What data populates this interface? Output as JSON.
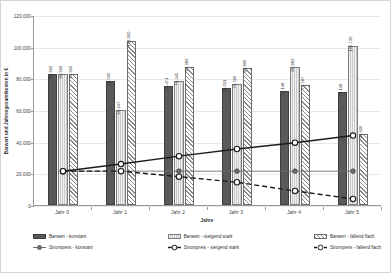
{
  "chart_data": {
    "type": "bar",
    "title": "",
    "subtitle": "",
    "xlabel": "Jahre",
    "ylabel": "Barwert und Jahresgesamtkosten in €",
    "categories": [
      "Jahr 0",
      "Jahr 1",
      "Jahr 2",
      "Jahr 3",
      "Jahr 4",
      "Jahr 5"
    ],
    "ylim": [
      0,
      120000
    ],
    "ytick_labels": [
      "0",
      "20.000",
      "40.000",
      "60.000",
      "80.000",
      "100.000",
      "120.000"
    ],
    "ytick_values": [
      0,
      20000,
      40000,
      60000,
      80000,
      100000,
      120000
    ],
    "grid": true,
    "legend_position": "bottom",
    "bar_series": [
      {
        "name": "Barwert - konstant",
        "style": "solid-dark-gray",
        "color": "#595959",
        "values": [
          82916,
          78505,
          75471,
          74031,
          72148,
          71148
        ],
        "labels": [
          "82.916",
          "78.505",
          "75.471",
          "74.031",
          "72.148",
          "71.148"
        ]
      },
      {
        "name": "Barwert - steigend stark",
        "style": "solid-light-gray",
        "color": "#c9c9c9",
        "values": [
          82916,
          60047,
          78345,
          76320,
          86883,
          100729
        ],
        "labels": [
          "82.916",
          "60.047",
          "78.345",
          "76.320",
          "86.883",
          "100.729"
        ]
      },
      {
        "name": "Barwert - fallend flach",
        "style": "hatched-diagonal",
        "color": "#ffffff",
        "values": [
          82916,
          103900,
          87383,
          86806,
          75587,
          44936
        ],
        "labels": [
          "82.916",
          "103.900",
          "87.383",
          "86.806",
          "75.587",
          "44.936"
        ]
      }
    ],
    "line_series": [
      {
        "name": "Strompreis - konstant",
        "style": "solid-thin-gray-filled-marker",
        "color": "#6f6f6f",
        "marker": "filled-circle",
        "values": [
          22000,
          22000,
          22000,
          22000,
          22000,
          22000
        ]
      },
      {
        "name": "Strompreis - steigend stark",
        "style": "solid-thick-black-open-marker",
        "color": "#1c1c1c",
        "marker": "open-circle",
        "values": [
          22000,
          26500,
          31500,
          36000,
          40000,
          44500
        ]
      },
      {
        "name": "Strompreis - fallend flach",
        "style": "dashed-black-open-marker",
        "color": "#1c1c1c",
        "marker": "open-circle",
        "values": [
          22000,
          22000,
          18500,
          15000,
          9500,
          4500
        ]
      }
    ]
  },
  "legend": {
    "columns": [
      {
        "bar": "Barwert - konstant",
        "line": "Strompreis - konstant"
      },
      {
        "bar": "Barwert - steigend stark",
        "line": "Strompreis - steigend stark"
      },
      {
        "bar": "Barwert - fallend flach",
        "line": "Strompreis - fallend flach"
      }
    ]
  }
}
